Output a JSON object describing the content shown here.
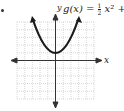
{
  "problem": {
    "bullet": "•",
    "function_label_lhs": "g(x) = ",
    "fraction_num": "1",
    "fraction_den": "2",
    "function_label_rhs": "x² + 1",
    "axis_x_label": "x",
    "axis_y_label": "y"
  },
  "graph": {
    "grid_cells_x": 10,
    "grid_cells_y": 10,
    "x_range": [
      -5,
      5
    ],
    "y_range": [
      -5,
      5
    ],
    "curve": "parabola",
    "vertex": [
      0,
      1
    ],
    "stroke_color": "#1a1a1a",
    "grid_color": "#b8b8b8"
  }
}
